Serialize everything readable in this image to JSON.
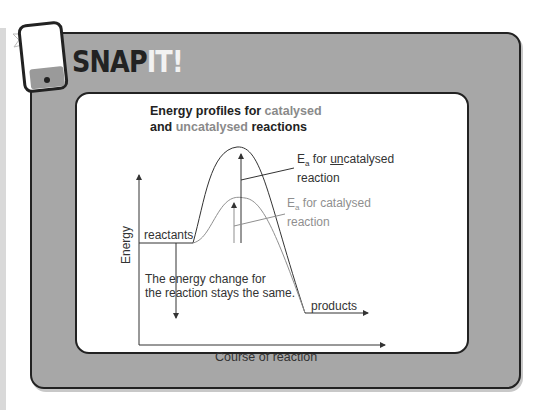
{
  "header": {
    "title_main": "SNAP",
    "title_highlight": "IT!",
    "icon": "phone-flash-icon"
  },
  "diagram": {
    "title_part1": "Energy profiles for ",
    "title_catalysed": "catalysed",
    "title_part2": "and ",
    "title_uncatalysed": "uncatalysed",
    "title_part3": " reactions",
    "y_axis_label": "Energy",
    "x_axis_label": "Course of reaction",
    "reactants_label": "reactants",
    "products_label": "products",
    "energy_change_line1": "The energy change for",
    "energy_change_line2": "the reaction stays the same.",
    "ea_uncat_E": "E",
    "ea_uncat_sub": "a",
    "ea_uncat_for": " for ",
    "ea_uncat_un": "un",
    "ea_uncat_rest": "catalysed",
    "ea_uncat_line2": "reaction",
    "ea_cat_E": "E",
    "ea_cat_sub": "a",
    "ea_cat_rest": " for catalysed",
    "ea_cat_line2": "reaction",
    "colors": {
      "uncatalysed": "#333333",
      "catalysed": "#8f8f8f",
      "panel": "#a7a7a7"
    }
  }
}
